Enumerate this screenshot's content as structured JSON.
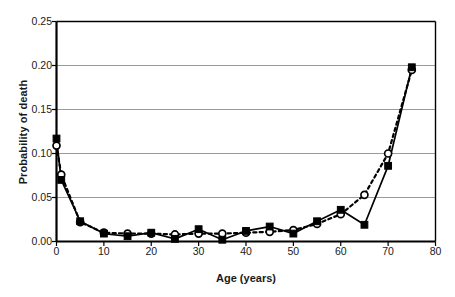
{
  "chart_data": {
    "type": "line",
    "title": "",
    "xlabel": "Age (years)",
    "ylabel": "Probability of death",
    "xlim": [
      0,
      80
    ],
    "ylim": [
      0,
      0.25
    ],
    "xticks": [
      0,
      10,
      20,
      30,
      40,
      50,
      60,
      70,
      80
    ],
    "xtick_labels": [
      "0",
      "10",
      "20",
      "30",
      "40",
      "50",
      "60",
      "70",
      "80"
    ],
    "yticks": [
      0.0,
      0.05,
      0.1,
      0.15,
      0.2,
      0.25
    ],
    "ytick_labels": [
      "0.00",
      "0.05",
      "0.10",
      "0.15",
      "0.20",
      "0.25"
    ],
    "grid": "horizontal",
    "legend": "none",
    "x": [
      0,
      1,
      5,
      10,
      15,
      20,
      25,
      30,
      35,
      40,
      45,
      50,
      55,
      60,
      65,
      70,
      75
    ],
    "series": [
      {
        "name": "filled-square-series",
        "marker": "filled-square",
        "line_style": "solid",
        "color": "#000000",
        "values": [
          0.117,
          0.07,
          0.023,
          0.009,
          0.006,
          0.01,
          0.003,
          0.014,
          0.002,
          0.012,
          0.017,
          0.009,
          0.023,
          0.036,
          0.019,
          0.086,
          0.198
        ]
      },
      {
        "name": "open-circle-series",
        "marker": "open-circle",
        "line_style": "dashed",
        "color": "#000000",
        "values": [
          0.109,
          0.076,
          0.022,
          0.01,
          0.009,
          0.009,
          0.008,
          0.009,
          0.009,
          0.01,
          0.011,
          0.013,
          0.02,
          0.031,
          0.053,
          0.1,
          0.195
        ]
      }
    ]
  },
  "style": {
    "axis_color": "#000000",
    "grid_color": "#9a9a9a",
    "plot_background": "#ffffff",
    "text_color": "#1a1a1a"
  }
}
